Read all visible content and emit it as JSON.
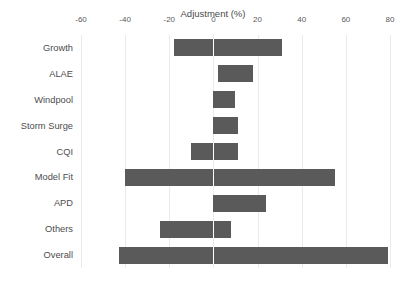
{
  "chart_data": {
    "type": "bar",
    "orientation": "horizontal",
    "subtype": "floating-range-bar-tornado",
    "title": "Adjustment (%)",
    "xlabel": "",
    "ylabel": "",
    "xlim": [
      -60,
      80
    ],
    "xticks": [
      -60,
      -40,
      -20,
      0,
      20,
      40,
      60,
      80
    ],
    "xtick_labels": [
      "-60",
      "-40",
      "-20",
      "0",
      "20",
      "40",
      "60",
      "80"
    ],
    "grid": "vertical-only",
    "legend": "none",
    "axis_position": "top",
    "categories": [
      "Growth",
      "ALAE",
      "Windpool",
      "Storm Surge",
      "CQI",
      "Model Fit",
      "APD",
      "Others",
      "Overall"
    ],
    "low": [
      -18,
      2,
      0,
      0,
      -10,
      -40,
      0,
      -24,
      -43
    ],
    "high": [
      31,
      18,
      10,
      11,
      11,
      55,
      24,
      8,
      79
    ],
    "bars": [
      {
        "category": "Growth",
        "low": -18,
        "high": 31
      },
      {
        "category": "ALAE",
        "low": 2,
        "high": 18
      },
      {
        "category": "Windpool",
        "low": 0,
        "high": 10
      },
      {
        "category": "Storm Surge",
        "low": 0,
        "high": 11
      },
      {
        "category": "CQI",
        "low": -10,
        "high": 11
      },
      {
        "category": "Model Fit",
        "low": -40,
        "high": 55
      },
      {
        "category": "APD",
        "low": 0,
        "high": 24
      },
      {
        "category": "Others",
        "low": -24,
        "high": 8
      },
      {
        "category": "Overall",
        "low": -43,
        "high": 79
      }
    ],
    "colors": {
      "bar": "#5a5a5a",
      "background": "#ffffff",
      "gridline": "#eaeaea",
      "text": "#4d4d4d",
      "zero_divider": "#ffffff"
    }
  }
}
